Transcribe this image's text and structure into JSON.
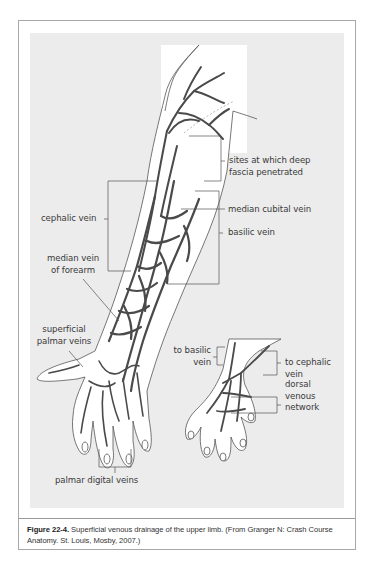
{
  "figure": {
    "labels": {
      "sites_fascia": [
        "sites at which deep",
        "fascia penetrated"
      ],
      "cephalic_vein": "cephalic vein",
      "median_cubital_vein": "median cubital vein",
      "basilic_vein": "basilic vein",
      "median_vein_forearm": [
        "median vein",
        "of forearm"
      ],
      "superficial_palmar_veins": [
        "superficial",
        "palmar veins"
      ],
      "palmar_digital_veins": "palmar digital veins",
      "to_basilic_vein": [
        "to basilic",
        "vein"
      ],
      "to_cephalic_vein": [
        "to cephalic",
        "vein"
      ],
      "dorsal_venous_network": [
        "dorsal",
        "venous",
        "network"
      ]
    },
    "caption": {
      "number": "Figure 22-4.",
      "text": " Superficial venous drainage of the upper limb. (From Granger N: Crash Course Anatomy. St. Louis, Mosby, 2007.)"
    },
    "colors": {
      "panel": "#ececec",
      "vein": "#4a4a4a",
      "outline": "#555555",
      "frame": "#a8a8a8"
    }
  }
}
